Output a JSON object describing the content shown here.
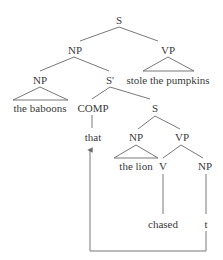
{
  "diagram": {
    "type": "syntax-tree",
    "colors": {
      "text": "#3a3a3a",
      "line": "#6a6a6a",
      "background": "#ffffff"
    },
    "nodes": {
      "s_root": "S",
      "np_subject": "NP",
      "vp_main": "VP",
      "np_head": "NP",
      "s_bar": "S'",
      "vp_main_text": "stole the pumpkins",
      "np_head_text": "the baboons",
      "comp": "COMP",
      "s_embedded": "S",
      "comp_text": "that",
      "np_embedded": "NP",
      "vp_embedded": "VP",
      "np_embedded_text": "the lion",
      "v": "V",
      "np_object": "NP",
      "v_text": "chased",
      "trace": "t"
    },
    "movement": {
      "from": "t",
      "to": "that",
      "arrow": "up-arrow"
    }
  }
}
